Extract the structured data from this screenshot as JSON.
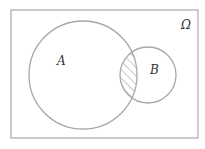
{
  "diagram": {
    "type": "venn",
    "universe_label": "Ω",
    "sets": [
      {
        "label": "A"
      },
      {
        "label": "B"
      }
    ],
    "shaded_region": "A ∩ B",
    "colors": {
      "stroke": "#a8a8a8",
      "hatch": "#a8a8a8",
      "text": "#333333",
      "background": "#ffffff"
    }
  }
}
